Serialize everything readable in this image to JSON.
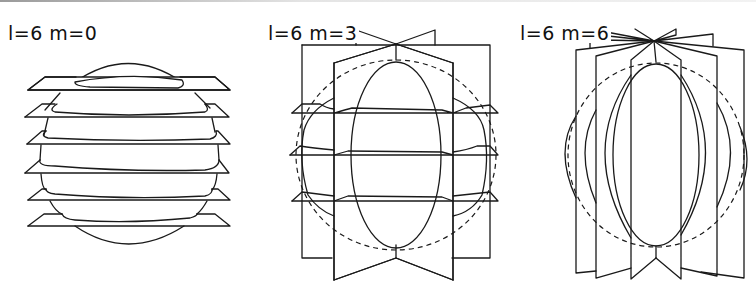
{
  "figure": {
    "panels": [
      {
        "label": "l=6  m=0",
        "l": 6,
        "m": 0,
        "nodal_planes_horizontal": 6,
        "nodal_planes_vertical": 0
      },
      {
        "label": "l=6  m=3",
        "l": 6,
        "m": 3,
        "nodal_planes_horizontal": 3,
        "nodal_planes_vertical": 3
      },
      {
        "label": "l=6 m=6",
        "l": 6,
        "m": 6,
        "nodal_planes_horizontal": 0,
        "nodal_planes_vertical": 6
      }
    ]
  },
  "style": {
    "line_color": "#1a1a1a",
    "background": "#ffffff"
  }
}
